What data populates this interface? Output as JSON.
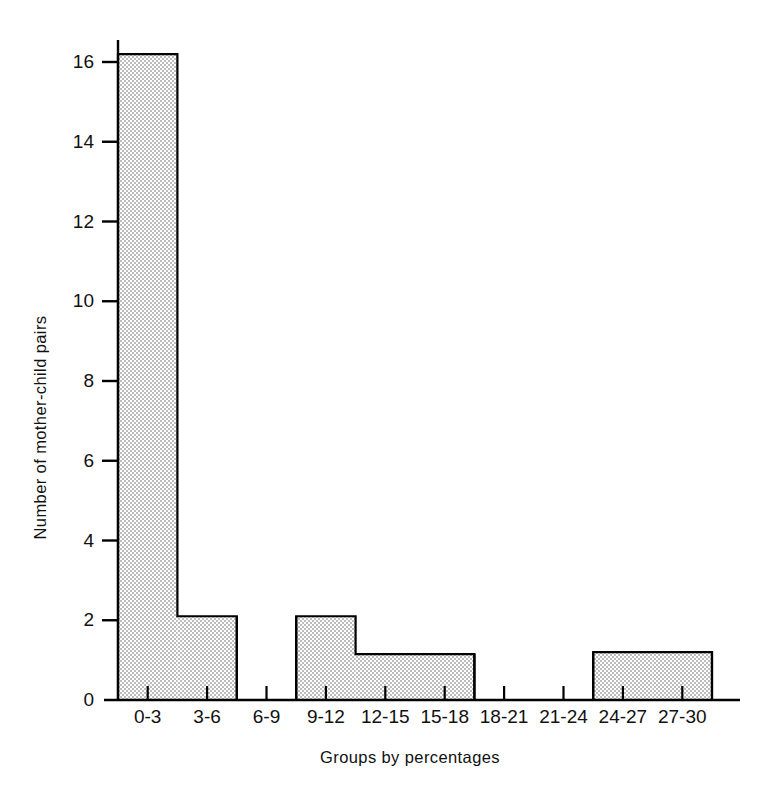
{
  "chart_data": {
    "type": "bar",
    "title": "",
    "subtitle": "",
    "xlabel": "Groups by percentages",
    "ylabel": "Number of mother-child pairs",
    "categories": [
      "0-3",
      "3-6",
      "6-9",
      "9-12",
      "12-15",
      "15-18",
      "18-21",
      "21-24",
      "24-27",
      "27-30"
    ],
    "values": [
      16.2,
      2.1,
      0,
      2.1,
      1.15,
      1.15,
      0,
      0,
      1.2,
      1.2
    ],
    "ylim": [
      0,
      17.5
    ],
    "yticks": [
      0,
      2,
      4,
      6,
      8,
      10,
      12,
      14,
      16
    ],
    "ytick_labels": [
      "0",
      "2",
      "4",
      "6",
      "8",
      "10",
      "12",
      "14",
      "16"
    ],
    "grid": false,
    "legend": null,
    "bar_fill": "#dcdcdc",
    "bar_edge": "#000000",
    "axis_color": "#000000",
    "background": "#ffffff",
    "fill_style": "fine-checker-stipple",
    "annotations": []
  },
  "axes": {
    "y_tick_count": 9,
    "x_tick_count": 11,
    "baseline_value": 0
  }
}
